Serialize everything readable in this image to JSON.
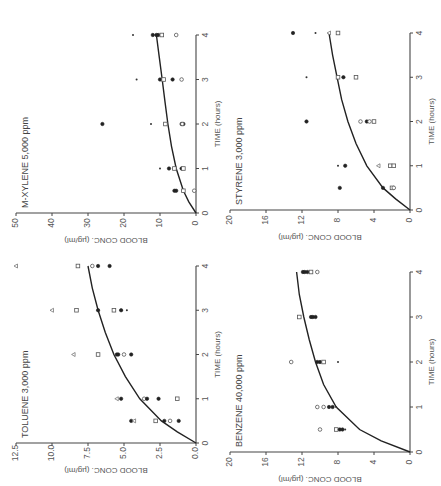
{
  "figure": {
    "orientation": "rotated 90 degrees counterclockwise",
    "panels_layout": "2x2"
  },
  "chart_data": [
    {
      "type": "scatter",
      "panel": "top-left",
      "title": "M-XYLENE 5,000 ppm",
      "xlabel": "TIME (hours)",
      "ylabel": "BLOOD CONC. (µg/ml)",
      "xlim": [
        0,
        4
      ],
      "ylim": [
        0,
        50
      ],
      "xticks": [
        "0",
        "1",
        "2",
        "3",
        "4"
      ],
      "yticks": [
        "0",
        "10",
        "20",
        "30",
        "40",
        "50"
      ],
      "fit_curve": {
        "x": [
          0,
          0.25,
          0.5,
          1,
          1.5,
          2,
          2.5,
          3,
          3.5,
          4
        ],
        "y": [
          0,
          2.0,
          3.5,
          5.5,
          6.8,
          7.8,
          8.6,
          9.4,
          10.2,
          11
        ]
      },
      "points": [
        {
          "x": 0.5,
          "y": 6,
          "marker": "filled"
        },
        {
          "x": 0.5,
          "y": 5.5,
          "marker": "filled"
        },
        {
          "x": 0.5,
          "y": 3.5,
          "marker": "square"
        },
        {
          "x": 0.5,
          "y": 0.5,
          "marker": "open"
        },
        {
          "x": 1,
          "y": 10,
          "marker": "star"
        },
        {
          "x": 1,
          "y": 7.5,
          "marker": "filled"
        },
        {
          "x": 1,
          "y": 6,
          "marker": "square"
        },
        {
          "x": 1,
          "y": 4,
          "marker": "filled"
        },
        {
          "x": 1,
          "y": 3.5,
          "marker": "square"
        },
        {
          "x": 2,
          "y": 26,
          "marker": "filled"
        },
        {
          "x": 2,
          "y": 12.5,
          "marker": "star"
        },
        {
          "x": 2,
          "y": 8.5,
          "marker": "square"
        },
        {
          "x": 2,
          "y": 4,
          "marker": "filled"
        },
        {
          "x": 2,
          "y": 3.5,
          "marker": "filled"
        },
        {
          "x": 2,
          "y": 3.8,
          "marker": "open"
        },
        {
          "x": 3,
          "y": 16.5,
          "marker": "star"
        },
        {
          "x": 3,
          "y": 10,
          "marker": "filled"
        },
        {
          "x": 3,
          "y": 9,
          "marker": "square"
        },
        {
          "x": 3,
          "y": 6.5,
          "marker": "filled"
        },
        {
          "x": 3,
          "y": 4,
          "marker": "open"
        },
        {
          "x": 4,
          "y": 17.5,
          "marker": "star"
        },
        {
          "x": 4,
          "y": 12,
          "marker": "filled"
        },
        {
          "x": 4,
          "y": 11,
          "marker": "filled"
        },
        {
          "x": 4,
          "y": 10.5,
          "marker": "filled"
        },
        {
          "x": 4,
          "y": 9.5,
          "marker": "square"
        },
        {
          "x": 4,
          "y": 5.5,
          "marker": "open"
        }
      ]
    },
    {
      "type": "scatter",
      "panel": "top-right",
      "title": "STYRENE 3,000 ppm",
      "xlabel": "TIME (hours)",
      "ylabel": "BLOOD CONC. (µg/ml)",
      "xlim": [
        0,
        4
      ],
      "ylim": [
        0,
        20
      ],
      "xticks": [
        "0",
        "1",
        "2",
        "3",
        "4"
      ],
      "yticks": [
        "0",
        "4",
        "8",
        "12",
        "16",
        "20"
      ],
      "fit_curve": {
        "x": [
          0,
          0.25,
          0.5,
          1,
          1.5,
          2,
          2.5,
          3,
          3.5,
          4
        ],
        "y": [
          0,
          1.6,
          3.0,
          4.8,
          6.0,
          6.9,
          7.6,
          8.1,
          8.6,
          9
        ]
      },
      "points": [
        {
          "x": 0.5,
          "y": 7.8,
          "marker": "filled"
        },
        {
          "x": 0.5,
          "y": 3.0,
          "marker": "filled"
        },
        {
          "x": 0.5,
          "y": 2.0,
          "marker": "square"
        },
        {
          "x": 0.5,
          "y": 1.8,
          "marker": "open"
        },
        {
          "x": 1,
          "y": 8.0,
          "marker": "star"
        },
        {
          "x": 1,
          "y": 7.2,
          "marker": "filled"
        },
        {
          "x": 1,
          "y": 3.5,
          "marker": "tri"
        },
        {
          "x": 1,
          "y": 2.2,
          "marker": "square"
        },
        {
          "x": 1,
          "y": 1.8,
          "marker": "square"
        },
        {
          "x": 2,
          "y": 11.5,
          "marker": "filled"
        },
        {
          "x": 2,
          "y": 5.5,
          "marker": "open"
        },
        {
          "x": 2,
          "y": 4.8,
          "marker": "filled"
        },
        {
          "x": 2,
          "y": 4.5,
          "marker": "open"
        },
        {
          "x": 2,
          "y": 4.0,
          "marker": "square"
        },
        {
          "x": 3,
          "y": 11.5,
          "marker": "star"
        },
        {
          "x": 3,
          "y": 8.0,
          "marker": "square"
        },
        {
          "x": 3,
          "y": 7.4,
          "marker": "filled"
        },
        {
          "x": 3,
          "y": 6.0,
          "marker": "square"
        },
        {
          "x": 4,
          "y": 13.0,
          "marker": "filled"
        },
        {
          "x": 4,
          "y": 10.5,
          "marker": "star"
        },
        {
          "x": 4,
          "y": 9.0,
          "marker": "tri"
        },
        {
          "x": 4,
          "y": 8.0,
          "marker": "square"
        }
      ]
    },
    {
      "type": "scatter",
      "panel": "bottom-left",
      "title": "TOLUENE 3,000 ppm",
      "xlabel": "TIME (hours)",
      "ylabel": "BLOOD CONC. (µg/ml)",
      "xlim": [
        0,
        4
      ],
      "ylim": [
        0,
        12.5
      ],
      "xticks": [
        "0",
        "1",
        "2",
        "3",
        "4"
      ],
      "yticks": [
        "0.0",
        "2.5",
        "5.0",
        "7.5",
        "10.0",
        "12.5"
      ],
      "fit_curve": {
        "x": [
          0,
          0.25,
          0.5,
          1,
          1.5,
          2,
          2.5,
          3,
          3.5,
          4
        ],
        "y": [
          0,
          1.3,
          2.4,
          3.9,
          4.9,
          5.7,
          6.3,
          6.8,
          7.2,
          7.5
        ]
      },
      "points": [
        {
          "x": 0.5,
          "y": 4.5,
          "marker": "filled"
        },
        {
          "x": 0.5,
          "y": 4.3,
          "marker": "tri"
        },
        {
          "x": 0.5,
          "y": 2.8,
          "marker": "square"
        },
        {
          "x": 0.5,
          "y": 2.2,
          "marker": "filled"
        },
        {
          "x": 0.5,
          "y": 1.8,
          "marker": "open"
        },
        {
          "x": 0.5,
          "y": 1.2,
          "marker": "filled"
        },
        {
          "x": 1,
          "y": 5.5,
          "marker": "tri"
        },
        {
          "x": 1,
          "y": 5.2,
          "marker": "filled"
        },
        {
          "x": 1,
          "y": 3.6,
          "marker": "open"
        },
        {
          "x": 1,
          "y": 3.4,
          "marker": "filled"
        },
        {
          "x": 1,
          "y": 2.6,
          "marker": "filled"
        },
        {
          "x": 1,
          "y": 1.3,
          "marker": "square"
        },
        {
          "x": 2,
          "y": 8.5,
          "marker": "tri"
        },
        {
          "x": 2,
          "y": 6.8,
          "marker": "square"
        },
        {
          "x": 2,
          "y": 5.5,
          "marker": "filled"
        },
        {
          "x": 2,
          "y": 5.4,
          "marker": "filled"
        },
        {
          "x": 2,
          "y": 5.0,
          "marker": "open"
        },
        {
          "x": 2,
          "y": 4.5,
          "marker": "filled"
        },
        {
          "x": 3,
          "y": 10.0,
          "marker": "tri"
        },
        {
          "x": 3,
          "y": 8.3,
          "marker": "square"
        },
        {
          "x": 3,
          "y": 6.8,
          "marker": "filled"
        },
        {
          "x": 3,
          "y": 5.7,
          "marker": "square"
        },
        {
          "x": 3,
          "y": 5.2,
          "marker": "filled"
        },
        {
          "x": 3,
          "y": 4.8,
          "marker": "star"
        },
        {
          "x": 4,
          "y": 12.5,
          "marker": "tri"
        },
        {
          "x": 4,
          "y": 8.2,
          "marker": "square"
        },
        {
          "x": 4,
          "y": 7.2,
          "marker": "open"
        },
        {
          "x": 4,
          "y": 6.8,
          "marker": "filled"
        },
        {
          "x": 4,
          "y": 6.0,
          "marker": "filled"
        }
      ]
    },
    {
      "type": "scatter",
      "panel": "bottom-right",
      "title": "BENZENE 40,000 ppm",
      "xlabel": "TIME (hours)",
      "ylabel": "BLOOD CONC. (µg/ml)",
      "xlim": [
        0,
        4
      ],
      "ylim": [
        0,
        20
      ],
      "xticks": [
        "0",
        "1",
        "2",
        "3",
        "4"
      ],
      "yticks": [
        "0",
        "4",
        "8",
        "12",
        "16",
        "20"
      ],
      "fit_curve": {
        "x": [
          0,
          0.25,
          0.5,
          1,
          1.5,
          2,
          2.5,
          3,
          3.5,
          4
        ],
        "y": [
          0,
          3.2,
          5.6,
          8.2,
          9.6,
          10.5,
          11.2,
          11.8,
          12.3,
          12.6
        ]
      },
      "points": [
        {
          "x": 0.5,
          "y": 10.0,
          "marker": "open"
        },
        {
          "x": 0.5,
          "y": 8.2,
          "marker": "square"
        },
        {
          "x": 0.5,
          "y": 7.8,
          "marker": "filled"
        },
        {
          "x": 0.5,
          "y": 7.5,
          "marker": "filled"
        },
        {
          "x": 0.5,
          "y": 7.2,
          "marker": "star"
        },
        {
          "x": 1,
          "y": 10.3,
          "marker": "open"
        },
        {
          "x": 1,
          "y": 9.6,
          "marker": "open"
        },
        {
          "x": 1,
          "y": 9.0,
          "marker": "filled"
        },
        {
          "x": 1,
          "y": 8.6,
          "marker": "filled"
        },
        {
          "x": 1,
          "y": 8.2,
          "marker": "star"
        },
        {
          "x": 2,
          "y": 13.2,
          "marker": "open"
        },
        {
          "x": 2,
          "y": 10.3,
          "marker": "filled"
        },
        {
          "x": 2,
          "y": 10.0,
          "marker": "filled"
        },
        {
          "x": 2,
          "y": 9.6,
          "marker": "square"
        },
        {
          "x": 2,
          "y": 8.0,
          "marker": "star"
        },
        {
          "x": 3,
          "y": 12.3,
          "marker": "square"
        },
        {
          "x": 3,
          "y": 11.0,
          "marker": "filled"
        },
        {
          "x": 3,
          "y": 10.8,
          "marker": "filled"
        },
        {
          "x": 3,
          "y": 10.5,
          "marker": "filled"
        },
        {
          "x": 4,
          "y": 11.9,
          "marker": "filled"
        },
        {
          "x": 4,
          "y": 11.7,
          "marker": "filled"
        },
        {
          "x": 4,
          "y": 11.4,
          "marker": "filled"
        },
        {
          "x": 4,
          "y": 11.0,
          "marker": "square"
        },
        {
          "x": 4,
          "y": 10.3,
          "marker": "open"
        }
      ]
    }
  ]
}
